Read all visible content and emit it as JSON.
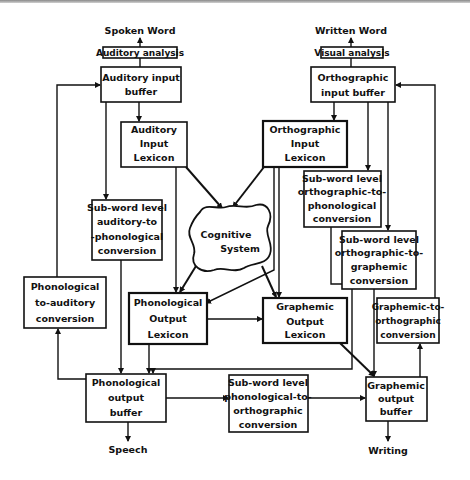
{
  "inputs": {
    "spoken_word": "Spoken Word",
    "written_word": "Written Word"
  },
  "outputs": {
    "speech": "Speech",
    "writing": "Writing"
  },
  "boxes": {
    "auditory_analysis": [
      "Auditory analysis"
    ],
    "visual_analysis": [
      "Visual analysis"
    ],
    "auditory_input_buffer": [
      "Auditory input",
      "buffer"
    ],
    "orthographic_input_buffer": [
      "Orthographic",
      "input buffer"
    ],
    "auditory_input_lexicon": [
      "Auditory",
      "Input",
      "Lexicon"
    ],
    "orthographic_input_lexicon": [
      "Orthographic",
      "Input",
      "Lexicon"
    ],
    "subword_ortho_to_phono": [
      "Sub-word level",
      "orthographic-to-",
      "phonological",
      "conversion"
    ],
    "subword_auditory_to_phono": [
      "Sub-word level",
      "auditory-to",
      "-phonological",
      "conversion"
    ],
    "subword_ortho_to_graphemic": [
      "Sub-word level",
      "orthographic-to-",
      "graphemic",
      "conversion"
    ],
    "phonological_to_auditory": [
      "Phonological",
      "to-auditory",
      "conversion"
    ],
    "phonological_output_lexicon": [
      "Phonological",
      "Output",
      "Lexicon"
    ],
    "graphemic_output_lexicon": [
      "Graphemic",
      "Output",
      "Lexicon"
    ],
    "graphemic_to_orthographic": [
      "Graphemic-to-",
      "orthographic",
      "conversion"
    ],
    "phonological_output_buffer": [
      "Phonological",
      "output",
      "buffer"
    ],
    "subword_phono_to_ortho": [
      "Sub-word level",
      "phonological-to-",
      "orthographic",
      "conversion"
    ],
    "graphemic_output_buffer": [
      "Graphemic",
      "output",
      "buffer"
    ]
  },
  "cognitive_system": [
    "Cognitive",
    "System"
  ]
}
